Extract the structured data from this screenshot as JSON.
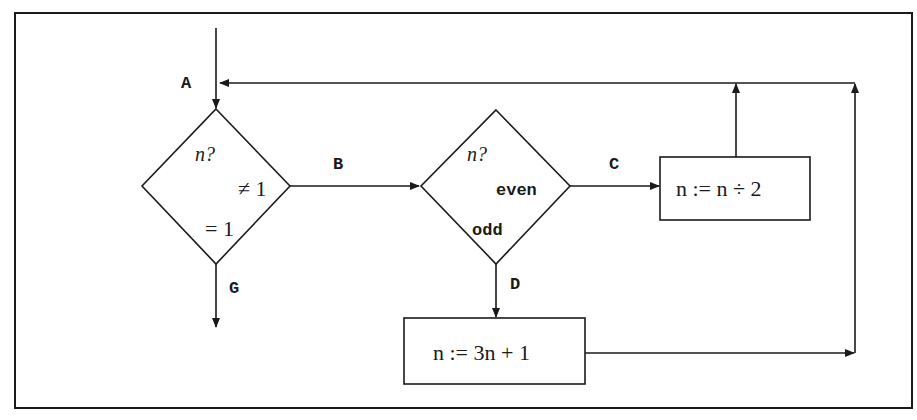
{
  "diagram": {
    "type": "flowchart",
    "edge_labels": {
      "A": "A",
      "B": "B",
      "C": "C",
      "D": "D",
      "G": "G"
    },
    "decision1": {
      "question": "n?",
      "branch_not_one": "≠ 1",
      "branch_one": "= 1"
    },
    "decision2": {
      "question": "n?",
      "branch_even": "even",
      "branch_odd": "odd"
    },
    "process_halve": {
      "text": "n := n ÷ 2"
    },
    "process_triple": {
      "text": "n := 3n + 1"
    },
    "colors": {
      "stroke": "#1a1a1a",
      "background": "#ffffff"
    }
  }
}
